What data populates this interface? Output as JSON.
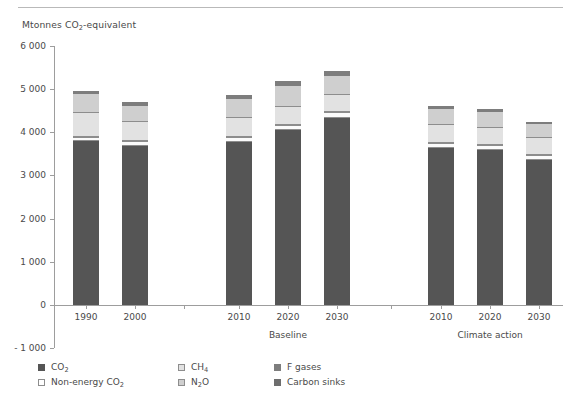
{
  "figure": {
    "axis_title": "Mtonnes CO",
    "axis_title_sub": "2",
    "axis_title_tail": "-equivalent"
  },
  "chart_data": {
    "type": "bar",
    "stacked": true,
    "title": "",
    "subtitle": "",
    "xlabel": "",
    "ylabel": "Mtonnes CO2-equivalent",
    "ylim": [
      -1000,
      6000
    ],
    "ytick_labels": [
      "6 000",
      "5 000",
      "4 000",
      "3 000",
      "2 000",
      "1 000",
      "0",
      "- 1 000"
    ],
    "ytick_values": [
      6000,
      5000,
      4000,
      3000,
      2000,
      1000,
      0,
      -1000
    ],
    "grid": false,
    "legend_position": "bottom",
    "categories": [
      "1990",
      "2000",
      "2010",
      "2020",
      "2030",
      "2010",
      "2020",
      "2030"
    ],
    "groups": [
      {
        "label": "",
        "categories": [
          "1990",
          "2000"
        ]
      },
      {
        "label": "Baseline",
        "categories": [
          "2010",
          "2020",
          "2030"
        ]
      },
      {
        "label": "Climate action",
        "categories": [
          "2010",
          "2020",
          "2030"
        ]
      }
    ],
    "series": [
      {
        "name": "CO2",
        "key": "co2",
        "color": "#555555",
        "values": [
          3790,
          3680,
          3780,
          4050,
          4320,
          3640,
          3590,
          3360
        ]
      },
      {
        "name": "Non-energy CO2",
        "key": "nonenergy",
        "color": "#ffffff",
        "values": [
          110,
          120,
          120,
          130,
          140,
          120,
          120,
          120
        ]
      },
      {
        "name": "CH4",
        "key": "ch4",
        "color": "#e2e2e2",
        "values": [
          540,
          430,
          430,
          410,
          400,
          400,
          400,
          380
        ]
      },
      {
        "name": "N2O",
        "key": "n2o",
        "color": "#cfcfcf",
        "values": [
          440,
          390,
          440,
          480,
          450,
          380,
          360,
          330
        ]
      },
      {
        "name": "F gases",
        "key": "fgas",
        "color": "#7d7d7d",
        "values": [
          70,
          80,
          90,
          120,
          100,
          70,
          60,
          50
        ]
      },
      {
        "name": "Carbon sinks",
        "key": "sinks",
        "color": "#6e6e6e",
        "values": [
          0,
          0,
          0,
          0,
          0,
          0,
          0,
          0
        ]
      }
    ],
    "totals": [
      4950,
      4700,
      4860,
      5190,
      5410,
      4610,
      4530,
      4240
    ]
  },
  "legend": {
    "rows": [
      [
        {
          "key": "co2",
          "text": "CO",
          "sub": "2",
          "tail": "",
          "swatch": "sw-co2"
        },
        {
          "key": "ch4",
          "text": "CH",
          "sub": "4",
          "tail": "",
          "swatch": "sw-ch4"
        },
        {
          "key": "fgas",
          "text": "F gases",
          "sub": "",
          "tail": "",
          "swatch": "sw-fgas"
        }
      ],
      [
        {
          "key": "nonenergy",
          "text": "Non-energy CO",
          "sub": "2",
          "tail": "",
          "swatch": "sw-nonenergy"
        },
        {
          "key": "n2o",
          "text": "N",
          "sub": "2",
          "tail": "O",
          "swatch": "sw-n2o"
        },
        {
          "key": "sinks",
          "text": "Carbon sinks",
          "sub": "",
          "tail": "",
          "swatch": "sw-sinks"
        }
      ]
    ]
  }
}
